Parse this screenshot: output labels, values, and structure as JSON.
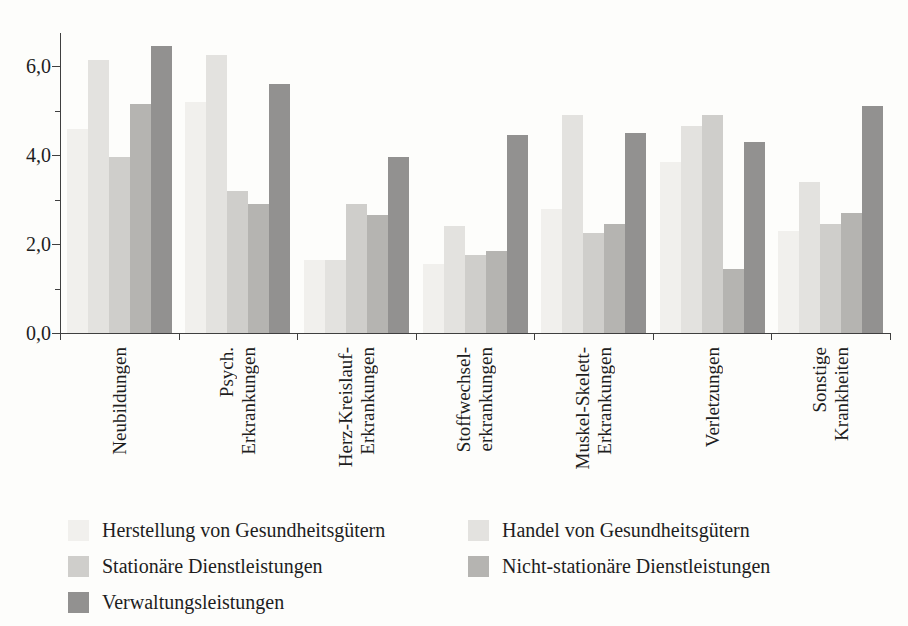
{
  "chart_data": {
    "type": "bar",
    "title": "",
    "xlabel": "",
    "ylabel": "",
    "grid": false,
    "ylim": [
      0,
      6.75
    ],
    "y_axis": {
      "major_tick_labels": [
        "0,0",
        "2,0",
        "4,0",
        "6,0"
      ],
      "major_tick_values": [
        0,
        2,
        4,
        6
      ],
      "minor_tick_values": [
        1,
        3,
        5
      ]
    },
    "categories": [
      {
        "id": "neubildungen",
        "lines": [
          "Neubildungen"
        ]
      },
      {
        "id": "psych-erkrankungen",
        "lines": [
          "Psych.",
          "Erkrankungen"
        ]
      },
      {
        "id": "herz-kreislauf-erkrankungen",
        "lines": [
          "Herz-Kreislauf-",
          "Erkrankungen"
        ]
      },
      {
        "id": "stoffwechselerkrankungen",
        "lines": [
          "Stoffwechsel-",
          "erkrankungen"
        ]
      },
      {
        "id": "muskel-skelett-erkrankungen",
        "lines": [
          "Muskel-Skelett-",
          "Erkrankungen"
        ]
      },
      {
        "id": "verletzungen",
        "lines": [
          "Verletzungen"
        ]
      },
      {
        "id": "sonstige-krankheiten",
        "lines": [
          "Sonstige",
          "Krankheiten"
        ]
      }
    ],
    "series": [
      {
        "name": "Herstellung von Gesundheitsgütern",
        "color": "#f1f0ed",
        "values": [
          4.6,
          5.2,
          1.65,
          1.55,
          2.8,
          3.85,
          2.3
        ]
      },
      {
        "name": "Handel von Gesundheitsgütern",
        "color": "#e3e2df",
        "values": [
          6.15,
          6.25,
          1.65,
          2.4,
          4.9,
          4.65,
          3.4
        ]
      },
      {
        "name": "Stationäre Dienstleistungen",
        "color": "#cfcecb",
        "values": [
          3.95,
          3.2,
          2.9,
          1.75,
          2.25,
          4.9,
          2.45
        ]
      },
      {
        "name": "Nicht-stationäre Dienstleistungen",
        "color": "#b5b4b1",
        "values": [
          5.15,
          2.9,
          2.65,
          1.85,
          2.45,
          1.45,
          2.7
        ]
      },
      {
        "name": "Verwaltungsleistungen",
        "color": "#929190",
        "values": [
          6.45,
          5.6,
          3.95,
          4.45,
          4.5,
          4.3,
          5.1
        ]
      }
    ],
    "legend": {
      "position": "bottom-left",
      "columns": 2,
      "rows": [
        [
          0,
          1
        ],
        [
          2,
          3
        ],
        [
          4
        ]
      ]
    }
  }
}
